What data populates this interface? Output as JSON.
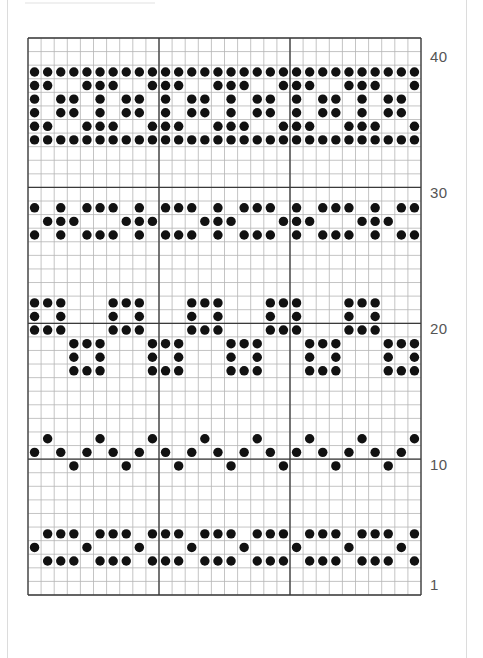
{
  "chart": {
    "title": "",
    "columns": 30,
    "rows": 41,
    "cell_width": 13.1,
    "cell_height": 13.585,
    "major_every": 10,
    "colors": {
      "minor_line": "#b5b5b5",
      "major_line": "#3a3a3a",
      "dot": "#111111",
      "label": "#555555"
    },
    "row_labels": [
      {
        "row": 40,
        "text": "40"
      },
      {
        "row": 30,
        "text": "30"
      },
      {
        "row": 20,
        "text": "20"
      },
      {
        "row": 10,
        "text": "10"
      },
      {
        "row": 1,
        "text": "1"
      }
    ],
    "pattern_rows": [
      {
        "row": 39,
        "rule": "all"
      },
      {
        "row": 38,
        "period": 5,
        "filled_mod": [
          0,
          1,
          2
        ]
      },
      {
        "row": 37,
        "period": 5,
        "filled_mod": [
          1,
          3,
          4
        ]
      },
      {
        "row": 36,
        "period": 5,
        "filled_mod": [
          1,
          3,
          4
        ]
      },
      {
        "row": 35,
        "period": 5,
        "filled_mod": [
          0,
          1,
          2
        ]
      },
      {
        "row": 34,
        "rule": "all"
      },
      {
        "row": 29,
        "period": 6,
        "filled_mod": [
          0,
          1,
          3,
          5
        ]
      },
      {
        "row": 28,
        "period": 6,
        "filled_mod": [
          2,
          3,
          4
        ]
      },
      {
        "row": 27,
        "period": 6,
        "filled_mod": [
          0,
          1,
          3,
          5
        ]
      },
      {
        "row": 22,
        "period": 6,
        "filled_mod": [
          1,
          2,
          3
        ]
      },
      {
        "row": 21,
        "period": 6,
        "filled_mod": [
          1,
          3
        ]
      },
      {
        "row": 20,
        "period": 6,
        "filled_mod": [
          1,
          2,
          3
        ]
      },
      {
        "row": 19,
        "period": 6,
        "filled_mod": [
          4,
          5,
          0
        ]
      },
      {
        "row": 18,
        "period": 6,
        "filled_mod": [
          4,
          0
        ]
      },
      {
        "row": 17,
        "period": 6,
        "filled_mod": [
          4,
          5,
          0
        ]
      },
      {
        "row": 12,
        "period": 4,
        "filled_mod": [
          2
        ]
      },
      {
        "row": 11,
        "period": 2,
        "filled_mod": [
          1
        ]
      },
      {
        "row": 10,
        "period": 4,
        "filled_mod": [
          0
        ]
      },
      {
        "row": 5,
        "period": 4,
        "filled_mod": [
          0,
          2,
          3
        ]
      },
      {
        "row": 4,
        "period": 4,
        "filled_mod": [
          1
        ]
      },
      {
        "row": 3,
        "period": 4,
        "filled_mod": [
          0,
          2,
          3
        ]
      }
    ]
  }
}
